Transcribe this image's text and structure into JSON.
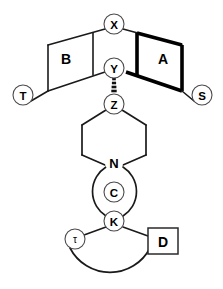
{
  "diagram": {
    "canvas": {
      "width": 223,
      "height": 289,
      "background": "#ffffff"
    },
    "ink_color": "#000000",
    "node_stroke": "#4a4a4a"
  },
  "ring_labels": {
    "ring_a": "A",
    "ring_b": "B",
    "ring_c": "C",
    "ring_d": "D"
  },
  "atom_labels": {
    "nitrogen": "N"
  },
  "node_labels": {
    "x": "X",
    "y": "Y",
    "z": "Z",
    "k": "K",
    "t_left": "T",
    "s_right": "S",
    "tau": "τ"
  },
  "bond_types": {
    "y_to_z": "hashed-wedge",
    "ring_a_edges": "bold",
    "ring_b_edges": "plain",
    "piperazine": "plain",
    "macrocycle_c": "plain-circle",
    "macrocycle_bottom": "plain-arc"
  },
  "geometry": {
    "x_node": {
      "cx": 114,
      "cy": 24,
      "r": 10
    },
    "y_node": {
      "cx": 114,
      "cy": 68,
      "r": 10
    },
    "z_node": {
      "cx": 114,
      "cy": 104,
      "r": 10
    },
    "n_atom": {
      "cx": 114,
      "cy": 163
    },
    "k_node": {
      "cx": 114,
      "cy": 221,
      "r": 10
    },
    "t_node": {
      "cx": 23,
      "cy": 95,
      "r": 10
    },
    "s_node": {
      "cx": 202,
      "cy": 95,
      "r": 10
    },
    "tau_node": {
      "cx": 75,
      "cy": 239,
      "r": 10
    },
    "d_box": {
      "x": 148,
      "y": 228,
      "w": 30,
      "h": 26
    },
    "ring_c_circle": {
      "cx": 114,
      "cy": 192,
      "r": 29
    },
    "ring_a_label": {
      "x": 163,
      "y": 59
    },
    "ring_b_label": {
      "x": 66,
      "y": 59
    },
    "ring_c_label": {
      "x": 114,
      "y": 192
    }
  }
}
